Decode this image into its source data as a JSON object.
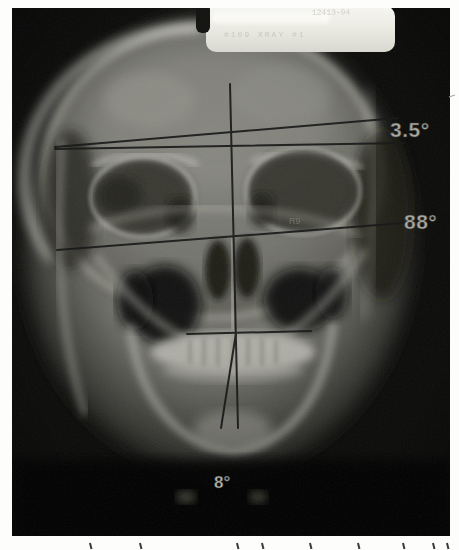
{
  "figure": {
    "name": "frontal-skull-radiograph-with-angle-measurements",
    "film_color": "#0a0a09",
    "tag": {
      "serial_text": "12413-94",
      "label_text": "#109  XRAY #1"
    },
    "film_marker": "R9",
    "angles": {
      "cranial_lines": {
        "label": "3.5°"
      },
      "occlusal_vertical": {
        "label": "88°"
      },
      "chin_deviation": {
        "label": "8°"
      }
    },
    "caption": {
      "marks_x": [
        90,
        140,
        237,
        262,
        310,
        358,
        403,
        433,
        447
      ]
    }
  },
  "colors": {
    "page": "#fdfdfc",
    "bone_bright": "#d6d6ce",
    "annotation_line": "#1b1b1b",
    "angle_label": "#a8a8a0",
    "chin_label": "#b4b4ac",
    "tag_face": "#e9e8e1"
  }
}
